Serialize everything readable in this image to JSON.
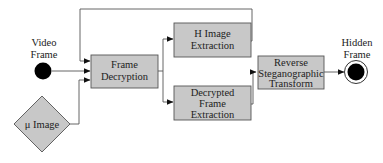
{
  "diagram": {
    "type": "flowchart",
    "colors": {
      "box_fill": "#c8c8c8",
      "stroke": "#555555",
      "node_fill": "#000000",
      "text": "#222222"
    },
    "start_node": {
      "label_line1": "Video",
      "label_line2": "Frame"
    },
    "input_node": {
      "label": "μ Image"
    },
    "boxes": {
      "frame_decryption": {
        "line1": "Frame",
        "line2": "Decryption"
      },
      "h_image_extraction": {
        "line1": "H Image",
        "line2": "Extraction"
      },
      "decrypted_frame_extraction": {
        "line1": "Decrypted",
        "line2": "Frame",
        "line3": "Extraction"
      },
      "reverse_transform": {
        "line1": "Reverse",
        "line2": "Steganographic",
        "line3": "Transform"
      }
    },
    "end_node": {
      "label_line1": "Hidden",
      "label_line2": "Frame"
    },
    "edges": [
      {
        "from": "Video Frame",
        "to": "Frame Decryption"
      },
      {
        "from": "μ Image",
        "to": "Frame Decryption"
      },
      {
        "from": "H Image Extraction",
        "to": "Frame Decryption",
        "style": "feedback loop over top"
      },
      {
        "from": "Frame Decryption",
        "to": "H Image Extraction"
      },
      {
        "from": "Frame Decryption",
        "to": "Decrypted Frame Extraction"
      },
      {
        "from": "Decrypted Frame Extraction",
        "to": "Reverse Steganographic Transform"
      },
      {
        "from": "Reverse Steganographic Transform",
        "to": "Hidden Frame"
      }
    ]
  }
}
